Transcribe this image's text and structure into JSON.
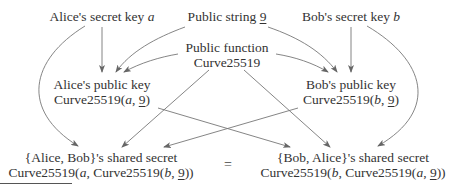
{
  "diagram": {
    "type": "flow",
    "nodes": {
      "alice_secret": {
        "label": "Alice's secret key ",
        "var": "a"
      },
      "public_string": {
        "label": "Public string ",
        "value": "9"
      },
      "bob_secret": {
        "label": "Bob's secret key ",
        "var": "b"
      },
      "public_function": {
        "line1": "Public function",
        "line2": "Curve25519"
      },
      "alice_public": {
        "line1": "Alice's public key",
        "fn": "Curve25519(",
        "var": "a",
        "sep": ", ",
        "value": "9",
        "close": ")"
      },
      "bob_public": {
        "line1": "Bob's public key",
        "fn": "Curve25519(",
        "var": "b",
        "sep": ", ",
        "value": "9",
        "close": ")"
      },
      "alice_shared": {
        "line1": "{Alice, Bob}'s shared secret",
        "fn_outer": "Curve25519(",
        "var_outer": "a",
        "fn_inner": ", Curve25519(",
        "var_inner": "b",
        "sep": ", ",
        "value": "9",
        "close": "))"
      },
      "bob_shared": {
        "line1": "{Bob, Alice}'s shared secret",
        "fn_outer": "Curve25519(",
        "var_outer": "b",
        "fn_inner": ", Curve25519(",
        "var_inner": "a",
        "sep": ", ",
        "value": "9",
        "close": "))"
      }
    },
    "equals": "=",
    "edges": [
      {
        "from": "alice_secret",
        "to": "alice_public"
      },
      {
        "from": "alice_secret",
        "to": "alice_shared"
      },
      {
        "from": "public_string",
        "to": "alice_public"
      },
      {
        "from": "public_string",
        "to": "bob_public"
      },
      {
        "from": "public_function",
        "to": "alice_public"
      },
      {
        "from": "public_function",
        "to": "bob_public"
      },
      {
        "from": "public_function",
        "to": "alice_shared"
      },
      {
        "from": "public_function",
        "to": "bob_shared"
      },
      {
        "from": "bob_secret",
        "to": "bob_public"
      },
      {
        "from": "bob_secret",
        "to": "bob_shared"
      },
      {
        "from": "alice_public",
        "to": "bob_shared"
      },
      {
        "from": "bob_public",
        "to": "alice_shared"
      }
    ],
    "colors": {
      "edge": "#666666",
      "text": "#333333",
      "background": "#ffffff"
    }
  }
}
